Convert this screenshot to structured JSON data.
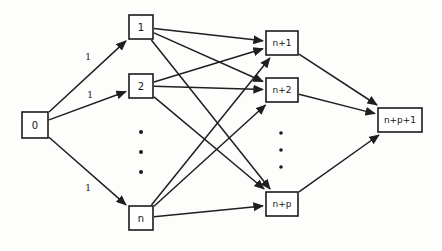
{
  "diagram": {
    "type": "directed-network-flow-graph",
    "title": "",
    "background_color": "#fdfdfc",
    "line_color": "#1f1f1f",
    "node_fill": "#ffffff",
    "nodes": [
      {
        "id": "source",
        "label": "0",
        "x": 35,
        "y": 125,
        "w": 26,
        "h": 26,
        "font_size": 10,
        "column": "source"
      },
      {
        "id": "left1",
        "label": "1",
        "x": 141,
        "y": 27,
        "w": 24,
        "h": 24,
        "font_size": 10,
        "column": "left"
      },
      {
        "id": "left2",
        "label": "2",
        "x": 141,
        "y": 86,
        "w": 24,
        "h": 24,
        "font_size": 10,
        "column": "left"
      },
      {
        "id": "leftn",
        "label": "n",
        "x": 141,
        "y": 218,
        "w": 24,
        "h": 24,
        "font_size": 10,
        "column": "left"
      },
      {
        "id": "right1",
        "label": "n+1",
        "x": 282,
        "y": 43,
        "w": 32,
        "h": 24,
        "font_size": 9,
        "column": "right"
      },
      {
        "id": "right2",
        "label": "n+2",
        "x": 282,
        "y": 90,
        "w": 32,
        "h": 24,
        "font_size": 9,
        "column": "right"
      },
      {
        "id": "rightp",
        "label": "n+p",
        "x": 282,
        "y": 204,
        "w": 32,
        "h": 24,
        "font_size": 9,
        "column": "right"
      },
      {
        "id": "sink",
        "label": "n+p+1",
        "x": 400,
        "y": 120,
        "w": 44,
        "h": 24,
        "font_size": 9,
        "column": "sink"
      }
    ],
    "edge_weight_labels": [
      {
        "text": "1",
        "x": 88,
        "y": 57
      },
      {
        "text": "1",
        "x": 90,
        "y": 95
      },
      {
        "text": "1",
        "x": 88,
        "y": 188
      }
    ],
    "ellipses": [
      {
        "id": "left-ellipsis",
        "x": 141,
        "y": 132,
        "count": 3,
        "spacing": 20,
        "radius": 2.0
      },
      {
        "id": "right-ellipsis",
        "x": 281,
        "y": 133,
        "count": 3,
        "spacing": 17,
        "radius": 1.8
      }
    ],
    "edges": [
      {
        "from": "source",
        "to": "left1",
        "weight": "1"
      },
      {
        "from": "source",
        "to": "left2",
        "weight": "1"
      },
      {
        "from": "source",
        "to": "leftn",
        "weight": "1"
      },
      {
        "from": "left1",
        "to": "right1",
        "weight": ""
      },
      {
        "from": "left1",
        "to": "right2",
        "weight": ""
      },
      {
        "from": "left1",
        "to": "rightp",
        "weight": ""
      },
      {
        "from": "left2",
        "to": "right1",
        "weight": ""
      },
      {
        "from": "left2",
        "to": "right2",
        "weight": ""
      },
      {
        "from": "left2",
        "to": "rightp",
        "weight": ""
      },
      {
        "from": "leftn",
        "to": "right1",
        "weight": ""
      },
      {
        "from": "leftn",
        "to": "right2",
        "weight": ""
      },
      {
        "from": "leftn",
        "to": "rightp",
        "weight": ""
      },
      {
        "from": "right1",
        "to": "sink",
        "weight": ""
      },
      {
        "from": "right2",
        "to": "sink",
        "weight": ""
      },
      {
        "from": "rightp",
        "to": "sink",
        "weight": ""
      }
    ]
  }
}
